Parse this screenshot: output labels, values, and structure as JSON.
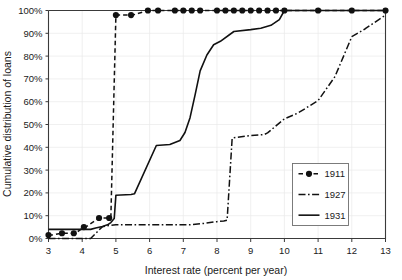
{
  "chart_data": {
    "type": "line",
    "title": "",
    "xlabel": "Interest rate (percent per year)",
    "ylabel": "Cumulative distribution of loans",
    "xlim": [
      3,
      13
    ],
    "ylim": [
      0,
      100
    ],
    "xticks": [
      "3",
      "4",
      "5",
      "6",
      "7",
      "8",
      "9",
      "10",
      "11",
      "12",
      "13"
    ],
    "yticks": [
      "0%",
      "10%",
      "20%",
      "30%",
      "40%",
      "50%",
      "60%",
      "70%",
      "80%",
      "90%",
      "100%"
    ],
    "grid": true,
    "legend_position": "center-right",
    "series": [
      {
        "name": "1911",
        "style": "dashed-with-markers",
        "x": [
          3.0,
          3.1,
          3.4,
          3.5,
          3.75,
          3.8,
          4.05,
          4.1,
          4.5,
          4.55,
          4.8,
          4.85,
          5.0,
          5.45,
          5.5,
          5.95,
          6.0,
          6.25,
          6.5,
          6.75,
          7.0,
          7.25,
          7.5,
          7.75,
          8.0,
          8.25,
          8.5,
          8.75,
          9.0,
          9.25,
          9.5,
          9.75,
          10.0,
          11.0,
          12.0,
          13.0
        ],
        "y": [
          1.5,
          1.5,
          2.3,
          2.3,
          2.3,
          2.3,
          5.0,
          5.0,
          9.0,
          9.0,
          9.0,
          9.0,
          98.0,
          98.0,
          98.0,
          100.0,
          100.0,
          100.0,
          100.0,
          100.0,
          100.0,
          100.0,
          100.0,
          100.0,
          100.0,
          100.0,
          100.0,
          100.0,
          100.0,
          100.0,
          100.0,
          100.0,
          100.0,
          100.0,
          100.0,
          100.0
        ],
        "markers_x": [
          3.0,
          3.4,
          3.75,
          4.05,
          4.5,
          4.8,
          5.0,
          5.45,
          5.95,
          6.25,
          6.75,
          7.0,
          7.25,
          7.5,
          8.0,
          8.25,
          8.5,
          8.75,
          9.0,
          9.25,
          9.5,
          9.75,
          10.0,
          11.0,
          12.0,
          13.0
        ],
        "markers_y": [
          1.5,
          2.3,
          2.3,
          5.0,
          9.0,
          9.0,
          98.0,
          98.0,
          100.0,
          100.0,
          100.0,
          100.0,
          100.0,
          100.0,
          100.0,
          100.0,
          100.0,
          100.0,
          100.0,
          100.0,
          100.0,
          100.0,
          100.0,
          100.0,
          100.0,
          100.0
        ]
      },
      {
        "name": "1927",
        "style": "dash-dot",
        "x": [
          3.0,
          4.25,
          4.45,
          4.6,
          4.85,
          5.0,
          7.2,
          7.6,
          8.0,
          8.2,
          8.3,
          8.45,
          8.5,
          9.0,
          9.4,
          9.5,
          10.0,
          10.4,
          11.0,
          11.5,
          12.0,
          12.4,
          13.0
        ],
        "y": [
          0.0,
          0.0,
          3.0,
          5.2,
          5.8,
          6.0,
          6.0,
          6.6,
          7.4,
          7.7,
          8.0,
          44.0,
          44.2,
          45.2,
          45.6,
          46.3,
          52.5,
          55.0,
          60.5,
          71.0,
          88.5,
          92.0,
          98.0
        ]
      },
      {
        "name": "1931",
        "style": "solid",
        "x": [
          3.0,
          4.25,
          4.4,
          4.6,
          4.75,
          4.85,
          4.95,
          5.0,
          5.45,
          5.55,
          6.2,
          6.6,
          6.9,
          7.05,
          7.2,
          7.35,
          7.5,
          7.7,
          7.9,
          8.1,
          8.5,
          9.0,
          9.3,
          9.6,
          9.85,
          10.0,
          11.0,
          12.0,
          13.0
        ],
        "y": [
          4.0,
          4.0,
          4.6,
          5.3,
          6.0,
          7.0,
          8.8,
          19.0,
          19.3,
          19.6,
          40.8,
          41.2,
          43.0,
          46.5,
          53.0,
          63.0,
          73.5,
          80.5,
          85.0,
          86.5,
          90.8,
          91.6,
          92.2,
          93.5,
          96.0,
          100.0,
          100.0,
          100.0,
          100.0
        ]
      }
    ]
  },
  "legend": {
    "entries": [
      {
        "label": "1911"
      },
      {
        "label": "1927"
      },
      {
        "label": "1931"
      }
    ]
  }
}
